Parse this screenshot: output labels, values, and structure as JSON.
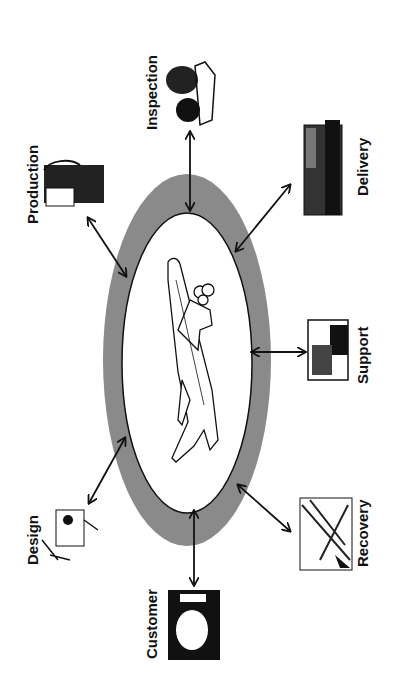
{
  "diagram": {
    "center": {
      "label": "",
      "icon": "airplane-icon"
    },
    "ring_color": "#8a8a8a",
    "nodes": [
      {
        "id": "inspection",
        "label": "Inspection",
        "icon": "inspection-icon"
      },
      {
        "id": "production",
        "label": "Production",
        "icon": "production-icon"
      },
      {
        "id": "delivery",
        "label": "Delivery",
        "icon": "delivery-truck-icon"
      },
      {
        "id": "support",
        "label": "Support",
        "icon": "support-computer-icon"
      },
      {
        "id": "recovery",
        "label": "Recovery",
        "icon": "recovery-icon"
      },
      {
        "id": "customer",
        "label": "Customer",
        "icon": "customer-portrait-icon"
      },
      {
        "id": "design",
        "label": "Design",
        "icon": "design-drafting-icon"
      }
    ]
  }
}
